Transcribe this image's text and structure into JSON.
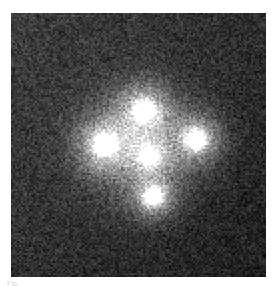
{
  "page": {
    "background_color": "#ffffff",
    "width": 278,
    "height": 286
  },
  "figure": {
    "kind": "astronomical-image",
    "frame": {
      "x": 11,
      "y": 13,
      "width": 255,
      "height": 264
    },
    "background_color": "#333333",
    "vignette": {
      "brightest_corner": "top-left",
      "brightest_color": "#3e3e3e",
      "darkest_corner": "bottom-right",
      "darkest_color": "#1f1f1f"
    },
    "noise": {
      "type": "grain",
      "amplitude": 26,
      "grain_size_px": 2
    },
    "halo": {
      "label": "diffuse lensing galaxy halo",
      "center_x": 128,
      "center_y": 132,
      "radius": 62,
      "peak_color": "#8e8e8e"
    },
    "sources": [
      {
        "name": "image-A-top",
        "label": "A",
        "x": 133,
        "y": 97,
        "radius": 17,
        "peak_brightness": 255,
        "core_color": "#ffffff"
      },
      {
        "name": "image-B-left",
        "label": "B",
        "x": 93,
        "y": 131,
        "radius": 18,
        "peak_brightness": 255,
        "core_color": "#ffffff"
      },
      {
        "name": "image-C-right",
        "label": "C",
        "x": 185,
        "y": 126,
        "radius": 17,
        "peak_brightness": 252,
        "core_color": "#fdfdfd"
      },
      {
        "name": "image-D-bottom",
        "label": "D",
        "x": 142,
        "y": 183,
        "radius": 15,
        "peak_brightness": 250,
        "core_color": "#fbfbfb"
      },
      {
        "name": "lens-galaxy-center",
        "label": "G",
        "x": 138,
        "y": 143,
        "radius": 13,
        "peak_brightness": 236,
        "core_color": "#f0f0f0"
      }
    ]
  },
  "caption": {
    "fragment_text": "Fig."
  }
}
